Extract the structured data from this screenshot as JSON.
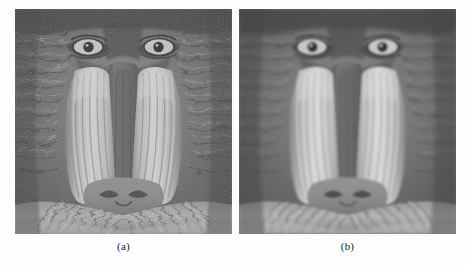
{
  "figure": {
    "background_color": "#fdfdfd",
    "panel_count": 2,
    "panel_width_px": 217,
    "panel_height_px": 225
  },
  "panels": [
    {
      "id": "a",
      "caption": "(a)",
      "image_name": "mandrill-noisy",
      "description": "grayscale mandrill face, grainy / noisy",
      "noise": "high",
      "smoothing": "none"
    },
    {
      "id": "b",
      "caption": "(b)",
      "image_name": "mandrill-denoised",
      "description": "grayscale mandrill face, smoothed / denoised",
      "noise": "low",
      "smoothing": "high"
    }
  ],
  "palette": {
    "background": "#fdfdfd",
    "fur_dark": "#3a3a3a",
    "fur_mid": "#6e6e6e",
    "fur_light": "#a8a8a8",
    "ridge_light": "#cfcfcf",
    "ridge_highlight": "#e3e3e3",
    "snout_mid": "#8a8a8a",
    "snout_dark": "#5a5a5a",
    "eye_white": "#d6d6d6",
    "eye_pupil": "#242424",
    "shadow": "#2a2a2a",
    "caption_color": "#1b1b1b"
  },
  "caption_style": {
    "font_size_px": 11,
    "align": "center"
  }
}
